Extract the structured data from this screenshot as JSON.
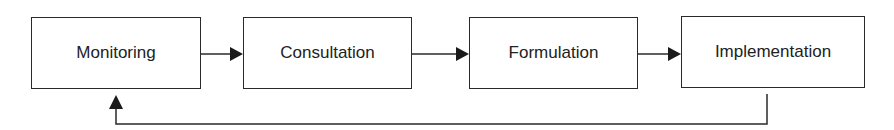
{
  "diagram": {
    "type": "process-cycle",
    "nodes": [
      {
        "id": "monitoring",
        "label": "Monitoring"
      },
      {
        "id": "consultation",
        "label": "Consultation"
      },
      {
        "id": "formulation",
        "label": "Formulation"
      },
      {
        "id": "implementation",
        "label": "Implementation"
      }
    ],
    "edges": [
      {
        "from": "monitoring",
        "to": "consultation"
      },
      {
        "from": "consultation",
        "to": "formulation"
      },
      {
        "from": "formulation",
        "to": "implementation"
      },
      {
        "from": "implementation",
        "to": "monitoring",
        "style": "feedback-loop"
      }
    ],
    "colors": {
      "stroke": "#2a2a2a",
      "text": "#222222",
      "background": "#ffffff"
    }
  }
}
